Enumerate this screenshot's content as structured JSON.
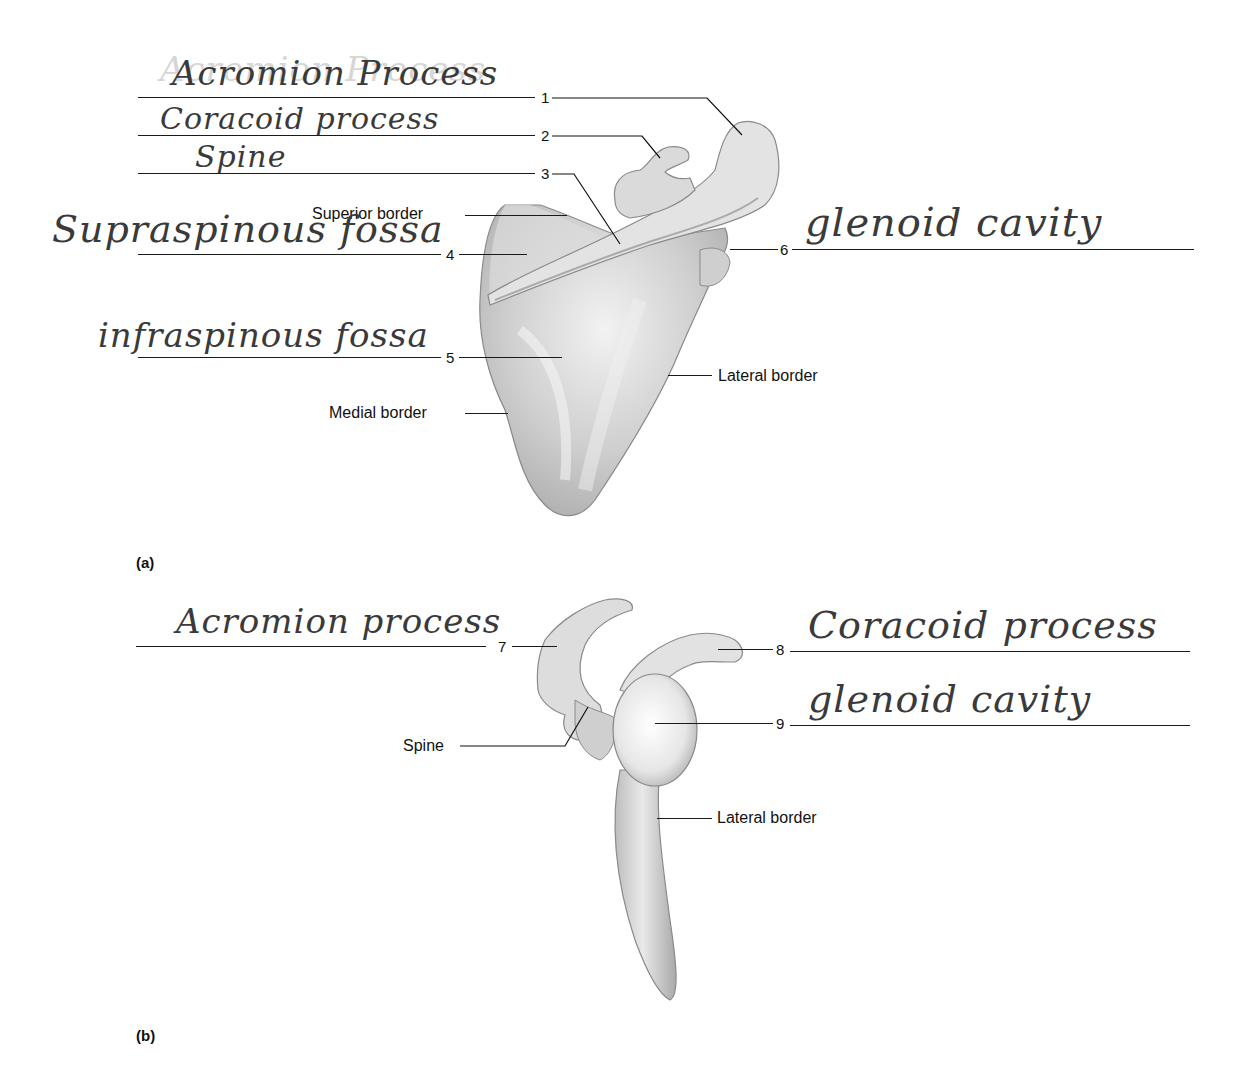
{
  "figure": {
    "panels": [
      {
        "id": "a",
        "label": "(a)",
        "view": "posterior view of right scapula",
        "printed_labels": {
          "superior_border": "Superior border",
          "medial_border": "Medial border",
          "lateral_border": "Lateral border"
        },
        "blanks": [
          {
            "number": "1",
            "answer": "Acromion Process"
          },
          {
            "number": "2",
            "answer": "Coracoid process"
          },
          {
            "number": "3",
            "answer": "Spine"
          },
          {
            "number": "4",
            "answer": "Supraspinous fossa"
          },
          {
            "number": "5",
            "answer": "infraspinous fossa"
          },
          {
            "number": "6",
            "answer": "glenoid cavity"
          }
        ]
      },
      {
        "id": "b",
        "label": "(b)",
        "view": "lateral view of right scapula",
        "printed_labels": {
          "spine": "Spine",
          "lateral_border": "Lateral border"
        },
        "blanks": [
          {
            "number": "7",
            "answer": "Acromion process"
          },
          {
            "number": "8",
            "answer": "Coracoid process"
          },
          {
            "number": "9",
            "answer": "glenoid cavity"
          }
        ]
      }
    ]
  },
  "colors": {
    "ink": "#111111",
    "handwriting": "#3a3a3a",
    "bone_light": "#eeeeee",
    "bone_mid": "#c8c8c8",
    "bone_dark": "#9a9a9a"
  }
}
